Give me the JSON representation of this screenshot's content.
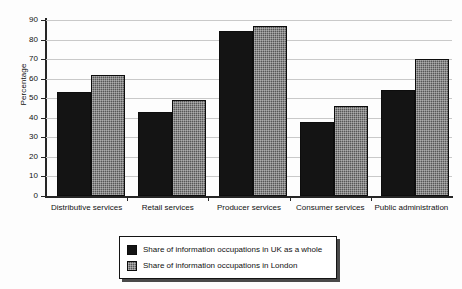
{
  "chart_data": {
    "type": "bar",
    "title": "",
    "subtitle": "",
    "xlabel": "",
    "ylabel": "Percentage",
    "ylim": [
      0,
      90
    ],
    "ytick_step": 10,
    "yticks": [
      0,
      10,
      20,
      30,
      40,
      50,
      60,
      70,
      80,
      90
    ],
    "grid": true,
    "grid_axis": "y",
    "legend_position": "below-center",
    "categories": [
      "Distributive services",
      "Retail services",
      "Producer services",
      "Consumer services",
      "Public administration"
    ],
    "series": [
      {
        "name": "Share of information occupations in UK as a whole",
        "color": "#141414",
        "values": [
          53,
          43,
          84.5,
          38,
          54
        ]
      },
      {
        "name": "Share of information occupations in London",
        "color": "#575757",
        "values": [
          62,
          49,
          87,
          46,
          70
        ]
      }
    ]
  },
  "legend": {
    "items": [
      {
        "label": "Share of information occupations in UK as a whole",
        "swatch": "dark"
      },
      {
        "label": "Share of information occupations in London",
        "swatch": "light"
      }
    ]
  }
}
